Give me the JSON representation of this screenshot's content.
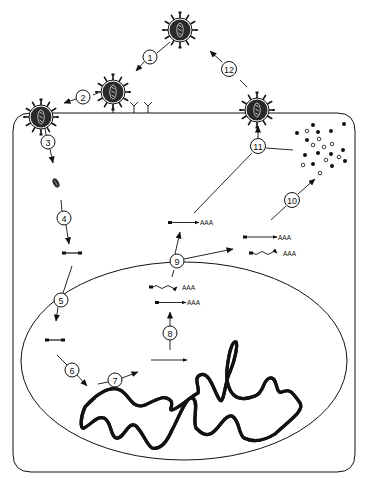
{
  "diagram": {
    "type": "viral-life-cycle",
    "colors": {
      "ink": "#111111",
      "background": "#ffffff",
      "virus_body": "#2a2a2a"
    },
    "steps": [
      {
        "id": 1,
        "label": "1",
        "x": 150,
        "y": 57
      },
      {
        "id": 2,
        "label": "2",
        "x": 83,
        "y": 97
      },
      {
        "id": 3,
        "label": "3",
        "x": 48,
        "y": 142
      },
      {
        "id": 4,
        "label": "4",
        "x": 64,
        "y": 218
      },
      {
        "id": 5,
        "label": "5",
        "x": 61,
        "y": 300
      },
      {
        "id": 6,
        "label": "6",
        "x": 72,
        "y": 370
      },
      {
        "id": 7,
        "label": "7",
        "x": 115,
        "y": 380
      },
      {
        "id": 8,
        "label": "8",
        "x": 170,
        "y": 333
      },
      {
        "id": 9,
        "label": "9",
        "x": 177,
        "y": 261
      },
      {
        "id": 10,
        "label": "10",
        "x": 292,
        "y": 200
      },
      {
        "id": 11,
        "label": "11",
        "x": 258,
        "y": 146
      },
      {
        "id": 12,
        "label": "12",
        "x": 229,
        "y": 69
      }
    ],
    "virions": [
      {
        "name": "free-virion",
        "x": 180,
        "y": 30
      },
      {
        "name": "attached-virion",
        "x": 113,
        "y": 92
      },
      {
        "name": "entering-virion",
        "x": 41,
        "y": 117
      },
      {
        "name": "budding-virion",
        "x": 257,
        "y": 110
      }
    ],
    "mrna_tail": "AAA",
    "transcripts": [
      {
        "name": "nuclear-spliced-mrna",
        "x": 148,
        "y": 288,
        "wavy": true
      },
      {
        "name": "nuclear-unspliced-mrna",
        "x": 156,
        "y": 303,
        "wavy": false
      },
      {
        "name": "cytoplasmic-mrna-upper",
        "x": 170,
        "y": 222,
        "wavy": false
      },
      {
        "name": "cytoplasmic-mrna-right-1",
        "x": 245,
        "y": 237,
        "wavy": false
      },
      {
        "name": "cytoplasmic-mrna-right-2",
        "x": 251,
        "y": 253,
        "wavy": true
      }
    ]
  }
}
